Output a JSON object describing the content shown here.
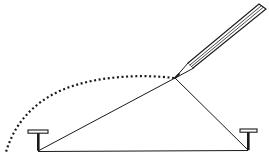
{
  "diagram": {
    "title": "",
    "colors": {
      "ink": "#1a1a1a",
      "background": "#ffffff"
    },
    "elements": {
      "left_pin": "thumbtack",
      "right_pin": "thumbtack",
      "string": "taut string loop forming a triangle",
      "pencil": "pencil",
      "trace": "dotted curve traced by pencil"
    }
  }
}
